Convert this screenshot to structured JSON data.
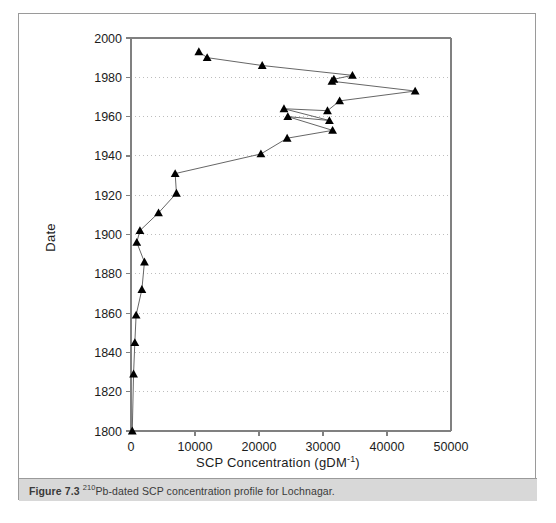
{
  "figure": {
    "caption_label": "Figure 7.3",
    "caption_isotope": "210",
    "caption_text": "Pb-dated SCP concentration profile for Lochnagar.",
    "border_color": "#9a9a9a",
    "caption_band_color": "#d8d8d8"
  },
  "chart_data": {
    "type": "line",
    "title": "",
    "xlabel": "SCP Concentration (gDM-1)",
    "xlabel_main": "SCP Concentration (gDM",
    "xlabel_sup": "-1",
    "xlabel_close": ")",
    "ylabel": "Date",
    "xlim": [
      0,
      50000
    ],
    "ylim": [
      1800,
      2000
    ],
    "xticks": [
      0,
      10000,
      20000,
      30000,
      40000,
      50000
    ],
    "xtick_labels": [
      "0",
      "10000",
      "20000",
      "30000",
      "40000",
      "50000"
    ],
    "yticks": [
      1800,
      1820,
      1840,
      1860,
      1880,
      1900,
      1920,
      1940,
      1960,
      1980,
      2000
    ],
    "ytick_labels": [
      "1800",
      "1820",
      "1840",
      "1860",
      "1880",
      "1900",
      "1920",
      "1940",
      "1960",
      "1980",
      "2000"
    ],
    "grid": "horizontal-dotted",
    "legend": "none",
    "marker": "triangle",
    "marker_color": "#000000",
    "line_color": "#555555",
    "series": [
      {
        "name": "SCP concentration",
        "points": [
          {
            "x": 10600,
            "y": 1993
          },
          {
            "x": 11900,
            "y": 1990
          },
          {
            "x": 20500,
            "y": 1986
          },
          {
            "x": 34600,
            "y": 1981
          },
          {
            "x": 31700,
            "y": 1979
          },
          {
            "x": 31400,
            "y": 1978
          },
          {
            "x": 44400,
            "y": 1973
          },
          {
            "x": 32600,
            "y": 1968
          },
          {
            "x": 30700,
            "y": 1963
          },
          {
            "x": 23900,
            "y": 1964
          },
          {
            "x": 31000,
            "y": 1958
          },
          {
            "x": 24500,
            "y": 1960
          },
          {
            "x": 31500,
            "y": 1953
          },
          {
            "x": 24400,
            "y": 1949
          },
          {
            "x": 20300,
            "y": 1941
          },
          {
            "x": 6900,
            "y": 1931
          },
          {
            "x": 7100,
            "y": 1921
          },
          {
            "x": 4300,
            "y": 1911
          },
          {
            "x": 1400,
            "y": 1902
          },
          {
            "x": 900,
            "y": 1896
          },
          {
            "x": 2100,
            "y": 1886
          },
          {
            "x": 1700,
            "y": 1872
          },
          {
            "x": 800,
            "y": 1859
          },
          {
            "x": 600,
            "y": 1845
          },
          {
            "x": 400,
            "y": 1829
          },
          {
            "x": 200,
            "y": 1800
          }
        ]
      }
    ]
  }
}
